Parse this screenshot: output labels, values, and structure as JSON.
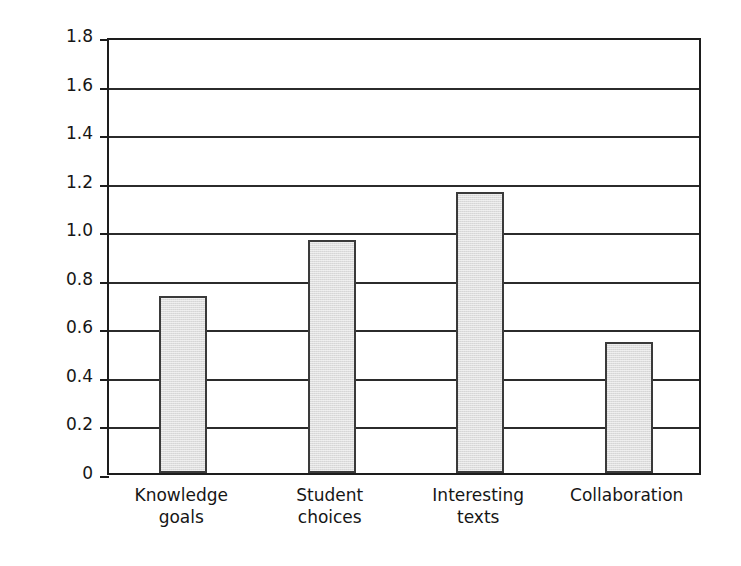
{
  "chart_data": {
    "type": "bar",
    "title": "",
    "xlabel": "",
    "ylabel": "Effect size",
    "categories": [
      "Knowledge goals",
      "Student choices",
      "Interesting texts",
      "Collaboration"
    ],
    "category_lines": [
      [
        "Knowledge",
        "goals"
      ],
      [
        "Student",
        "choices"
      ],
      [
        "Interesting",
        "texts"
      ],
      [
        "Collaboration"
      ]
    ],
    "values": [
      0.72,
      0.95,
      1.15,
      0.53
    ],
    "ylim": [
      0,
      1.8
    ],
    "ytick_values": [
      0,
      0.2,
      0.4,
      0.6,
      0.8,
      1.0,
      1.2,
      1.4,
      1.6,
      1.8
    ],
    "ytick_labels": [
      "0",
      "0.2",
      "0.4",
      "0.6",
      "0.8",
      "1.0",
      "1.2",
      "1.4",
      "1.6",
      "1.8"
    ],
    "grid": "horizontal",
    "legend": "none",
    "colors": {
      "bar_fill": "#dedede",
      "bar_edge": "#3a3a3a",
      "axis": "#1d1d1d",
      "gridline": "#2b2b2b",
      "background": "#ffffff",
      "text": "#161616"
    }
  }
}
